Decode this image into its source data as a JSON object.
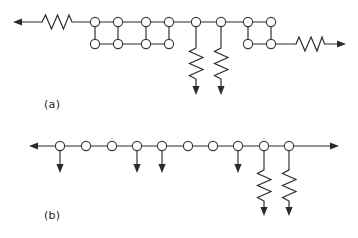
{
  "figure": {
    "type": "circuit-topology-diagram",
    "background_color": "#ffffff",
    "line_color": "#2b2b2b",
    "node_fill": "#ffffff",
    "node_stroke": "#3a3a3a",
    "panels": [
      {
        "id": "a",
        "label": "(a)",
        "description": "Horizontal chain containing three four-node square loops, two shunt resistor branches with downward arrows, a resistor terminated left arrow and a resistor terminated right arrow.",
        "node_count": 14,
        "square_loop_count": 3,
        "shunt_resistor_count": 2,
        "series_resistor_count": 2,
        "top_row_y": 22,
        "bottom_row_y": 44,
        "left_terminal": {
          "type": "arrow-left",
          "x": 14,
          "y": 22
        },
        "right_terminal": {
          "type": "arrow-right",
          "x": 346,
          "y": 44
        },
        "top_nodes_x": [
          95,
          118,
          146,
          169,
          196,
          221,
          248,
          271
        ],
        "bottom_nodes_x": [
          95,
          118,
          146,
          169,
          248,
          271
        ],
        "loops": [
          {
            "left_x": 95,
            "right_x": 118
          },
          {
            "left_x": 146,
            "right_x": 169
          },
          {
            "left_x": 248,
            "right_x": 271
          }
        ],
        "shunt_branches": [
          {
            "x": 196,
            "kind": "resistor",
            "arrow": "down",
            "end_y": 94
          },
          {
            "x": 221,
            "kind": "resistor",
            "arrow": "down",
            "end_y": 94
          }
        ],
        "left_series_resistor": {
          "from_x": 42,
          "to_x": 72
        },
        "right_series_resistor": {
          "from_x": 296,
          "to_x": 324
        }
      },
      {
        "id": "b",
        "label": "(b)",
        "description": "Single horizontal chain of ten nodes with left and right arrow terminals, four plain downward arrow stubs and two downward resistor branches.",
        "node_count": 10,
        "plain_branch_count": 4,
        "resistor_branch_count": 2,
        "row_y": 146,
        "left_terminal": {
          "type": "arrow-left",
          "x": 30,
          "y": 146
        },
        "right_terminal": {
          "type": "arrow-right",
          "x": 338,
          "y": 146
        },
        "nodes_x": [
          60,
          86,
          112,
          137,
          162,
          188,
          213,
          238,
          264,
          289
        ],
        "branches": [
          {
            "x": 60,
            "kind": "plain",
            "arrow": "down",
            "end_y": 172
          },
          {
            "x": 137,
            "kind": "plain",
            "arrow": "down",
            "end_y": 172
          },
          {
            "x": 162,
            "kind": "plain",
            "arrow": "down",
            "end_y": 172
          },
          {
            "x": 238,
            "kind": "plain",
            "arrow": "down",
            "end_y": 172
          },
          {
            "x": 264,
            "kind": "resistor",
            "arrow": "down",
            "end_y": 215
          },
          {
            "x": 289,
            "kind": "resistor",
            "arrow": "down",
            "end_y": 215
          }
        ]
      }
    ]
  }
}
